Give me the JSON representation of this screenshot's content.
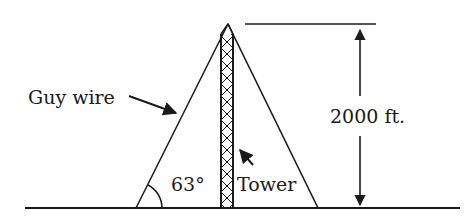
{
  "diagram": {
    "labels": {
      "guy_wire": "Guy wire",
      "angle": "63°",
      "tower": "Tower",
      "height": "2000 ft."
    },
    "values": {
      "angle_degrees": 63,
      "height_ft": 2000
    },
    "colors": {
      "stroke": "#1a1a1a",
      "background": "#ffffff"
    }
  }
}
